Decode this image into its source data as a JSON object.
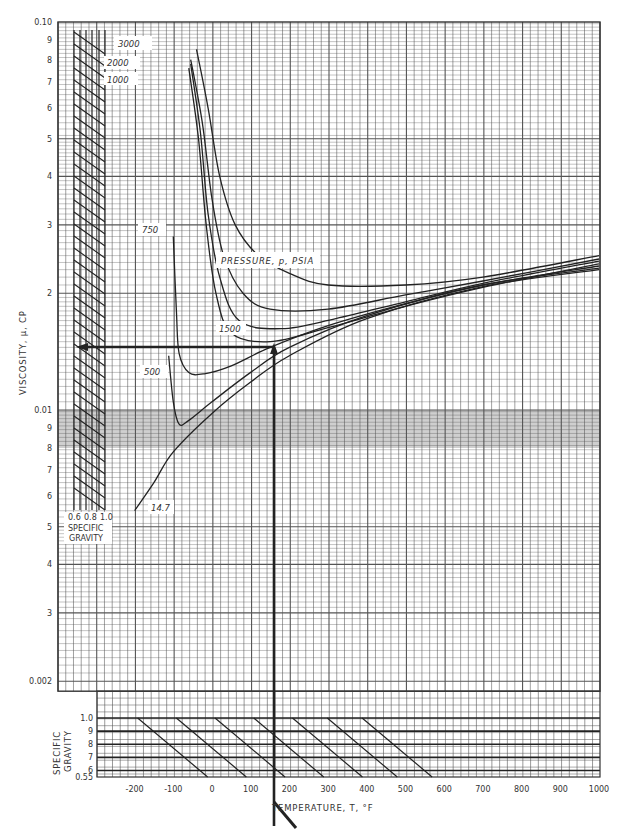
{
  "chart_data": {
    "type": "line",
    "title": "",
    "xlabel": "TEMPERATURE, T, °F",
    "ylabel": "VISCOSITY, μ, CP",
    "xlim": [
      -250,
      1000
    ],
    "ylim": [
      0.002,
      0.1
    ],
    "yscale": "log",
    "grid": true,
    "x_ticks": [
      "-200",
      "-100",
      "0",
      "100",
      "200",
      "300",
      "400",
      "500",
      "600",
      "700",
      "800",
      "900",
      "1000"
    ],
    "y_ticks": [
      {
        "value": 0.1,
        "label": "0.10"
      },
      {
        "value": 0.09,
        "label": "9"
      },
      {
        "value": 0.08,
        "label": "8"
      },
      {
        "value": 0.07,
        "label": "7"
      },
      {
        "value": 0.06,
        "label": "6"
      },
      {
        "value": 0.05,
        "label": "5"
      },
      {
        "value": 0.04,
        "label": "4"
      },
      {
        "value": 0.03,
        "label": "3"
      },
      {
        "value": 0.02,
        "label": "2"
      },
      {
        "value": 0.01,
        "label": "0.01"
      },
      {
        "value": 0.009,
        "label": "9"
      },
      {
        "value": 0.008,
        "label": "8"
      },
      {
        "value": 0.007,
        "label": "7"
      },
      {
        "value": 0.006,
        "label": "6"
      },
      {
        "value": 0.005,
        "label": "5"
      },
      {
        "value": 0.004,
        "label": "4"
      },
      {
        "value": 0.003,
        "label": "3"
      },
      {
        "value": 0.002,
        "label": "0.002"
      }
    ],
    "legend_title": "PRESSURE, p, PSIA",
    "series": [
      {
        "name": "3000",
        "points": [
          [
            -40,
            0.085
          ],
          [
            -10,
            0.06
          ],
          [
            20,
            0.04
          ],
          [
            60,
            0.03
          ],
          [
            120,
            0.025
          ],
          [
            200,
            0.0225
          ],
          [
            300,
            0.021
          ],
          [
            500,
            0.021
          ],
          [
            700,
            0.022
          ],
          [
            1000,
            0.025
          ]
        ]
      },
      {
        "name": "2000",
        "points": [
          [
            -55,
            0.08
          ],
          [
            -25,
            0.055
          ],
          [
            0,
            0.035
          ],
          [
            30,
            0.025
          ],
          [
            80,
            0.02
          ],
          [
            150,
            0.0182
          ],
          [
            300,
            0.0182
          ],
          [
            500,
            0.0198
          ],
          [
            700,
            0.0215
          ],
          [
            1000,
            0.0245
          ]
        ]
      },
      {
        "name": "1000",
        "points": [
          [
            -60,
            0.076
          ],
          [
            -35,
            0.05
          ],
          [
            -15,
            0.03
          ],
          [
            10,
            0.02
          ],
          [
            50,
            0.0158
          ],
          [
            150,
            0.015
          ],
          [
            300,
            0.0163
          ],
          [
            500,
            0.0185
          ],
          [
            700,
            0.0207
          ],
          [
            1000,
            0.0238
          ]
        ]
      },
      {
        "name": "1500",
        "points": [
          [
            -55,
            0.078
          ],
          [
            -30,
            0.052
          ],
          [
            -10,
            0.032
          ],
          [
            20,
            0.022
          ],
          [
            70,
            0.017
          ],
          [
            180,
            0.0162
          ],
          [
            320,
            0.0172
          ],
          [
            500,
            0.019
          ],
          [
            700,
            0.0212
          ],
          [
            1000,
            0.0242
          ]
        ]
      },
      {
        "name": "750",
        "points": [
          [
            -100,
            0.028
          ],
          [
            -92,
            0.018
          ],
          [
            -85,
            0.014
          ],
          [
            -60,
            0.0125
          ],
          [
            -20,
            0.0124
          ],
          [
            50,
            0.013
          ],
          [
            150,
            0.0145
          ],
          [
            300,
            0.0165
          ],
          [
            500,
            0.0188
          ],
          [
            700,
            0.021
          ],
          [
            1000,
            0.0235
          ]
        ]
      },
      {
        "name": "500",
        "points": [
          [
            -112,
            0.0138
          ],
          [
            -100,
            0.0105
          ],
          [
            -85,
            0.0092
          ],
          [
            -60,
            0.0094
          ],
          [
            0,
            0.0105
          ],
          [
            100,
            0.0125
          ],
          [
            200,
            0.0145
          ],
          [
            400,
            0.0175
          ],
          [
            700,
            0.021
          ],
          [
            1000,
            0.0232
          ]
        ]
      },
      {
        "name": "14.7",
        "points": [
          [
            -200,
            0.0055
          ],
          [
            -150,
            0.0065
          ],
          [
            -100,
            0.0078
          ],
          [
            0,
            0.0098
          ],
          [
            100,
            0.0118
          ],
          [
            200,
            0.0138
          ],
          [
            400,
            0.0172
          ],
          [
            700,
            0.0208
          ],
          [
            1000,
            0.023
          ]
        ]
      }
    ],
    "annotations": [
      {
        "type": "example-path",
        "description": "Vertical line up from T ≈ 160 °F (specific gravity scale) to curve, then horizontal line left to viscosity ≈ 0.0145 cp",
        "temperature": 160,
        "viscosity": 0.0145
      }
    ],
    "inset_specific_gravity_correction": {
      "title": "SPECIFIC GRAVITY",
      "x_ticks": [
        "0.6",
        "0.8",
        "1.0"
      ],
      "location": "left side, upper plot"
    },
    "bottom_specific_gravity_scale": {
      "ylabel": "SPECIFIC GRAVITY",
      "y_ticks": [
        "1.0",
        "9",
        "8",
        "7",
        "6",
        "0.55"
      ],
      "ylim": [
        0.55,
        1.0
      ]
    }
  },
  "labels": {
    "y_axis": "VISCOSITY, μ, CP",
    "x_axis": "TEMPERATURE, T, °F",
    "legend": "PRESSURE, p, PSIA",
    "sg_inset_ticks": [
      "0.6",
      "0.8",
      "1.0"
    ],
    "sg_inset_line1": "SPECIFIC",
    "sg_inset_line2": "GRAVITY",
    "sg_bottom_line1": "SPECIFIC",
    "sg_bottom_line2": "GRAVITY",
    "curve_3000": "3000",
    "curve_2000": "2000",
    "curve_1000": "1000",
    "curve_750": "750",
    "curve_1500": "1500",
    "curve_500": "500",
    "curve_14_7": "14.7"
  }
}
